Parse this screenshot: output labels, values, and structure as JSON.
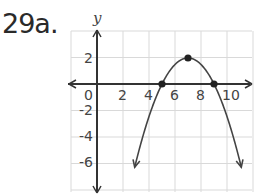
{
  "problem": {
    "label": "29a."
  },
  "chart_data": {
    "type": "line",
    "title": "",
    "xlabel": "x",
    "ylabel": "y",
    "xlim": [
      -2,
      12
    ],
    "ylim": [
      -8,
      4
    ],
    "grid": true,
    "x_tick_labels": [
      "0",
      "2",
      "4",
      "6",
      "8",
      "10"
    ],
    "y_tick_labels": [
      "2",
      "-2",
      "-4",
      "-6"
    ],
    "series": [
      {
        "name": "parabola",
        "equation": "y = -0.5(x - 7)^2 + 2",
        "vertex": [
          7,
          2
        ],
        "x_intercepts": [
          5,
          9
        ],
        "marked_points": [
          [
            5,
            0
          ],
          [
            7,
            2
          ],
          [
            9,
            0
          ]
        ],
        "opens": "down",
        "arrows_on_ends": true
      }
    ]
  },
  "colors": {
    "grid": "#d9d9d9",
    "axis": "#333333",
    "curve": "#444444",
    "point": "#222222"
  }
}
